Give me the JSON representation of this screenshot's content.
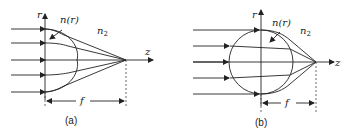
{
  "figure": {
    "panels": [
      {
        "id": "a",
        "caption": "(a)",
        "axis_r_label": "r",
        "axis_z_label": "z",
        "index_label": "n(r)",
        "medium_label": "n",
        "medium_subscript": "2",
        "focal_label": "f",
        "lens_shape": "half-lens (plano-convex profile)"
      },
      {
        "id": "b",
        "caption": "(b)",
        "axis_r_label": "r",
        "axis_z_label": "z",
        "index_label": "n(r)",
        "medium_label": "n",
        "medium_subscript": "2",
        "focal_label": "f",
        "lens_shape": "sphere"
      }
    ],
    "colors": {
      "stroke": "#222222",
      "background": "#ffffff"
    }
  }
}
